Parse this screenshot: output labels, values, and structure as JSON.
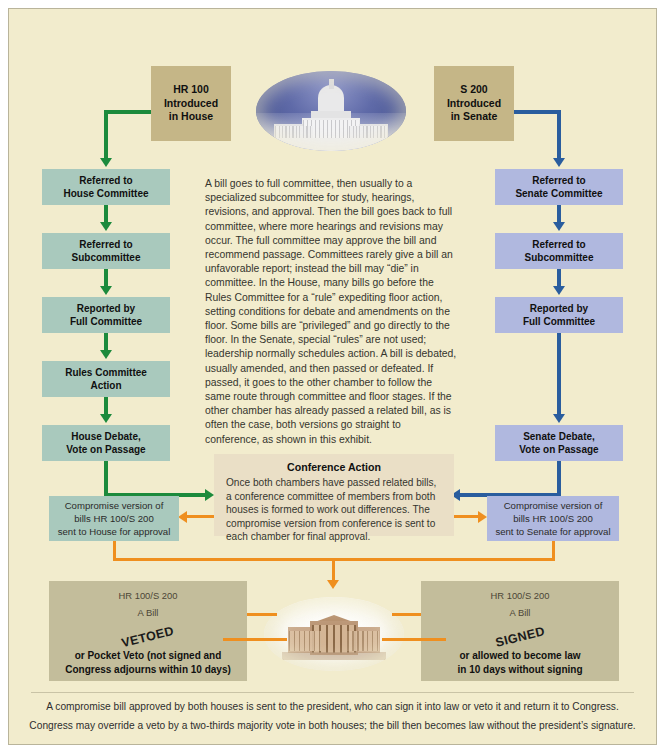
{
  "diagram": {
    "colors": {
      "background": "#f2eccd",
      "house_box": "#a9c9bd",
      "senate_box": "#b0b8df",
      "intro_box": "#c5b687",
      "conference_box": "#eadfc6",
      "bottom_box": "#c3bd9b",
      "house_arrow": "#1c8a3c",
      "senate_arrow": "#2a5d9e",
      "conference_arrow": "#ef8f1f"
    },
    "intro": {
      "house": "HR 100\nIntroduced\nin House",
      "house_lines": [
        "HR 100",
        "Introduced",
        "in House"
      ],
      "senate_lines": [
        "S 200",
        "Introduced",
        "in Senate"
      ]
    },
    "house_steps": [
      {
        "lines": [
          "Referred to",
          "House Committee"
        ]
      },
      {
        "lines": [
          "Referred to",
          "Subcommittee"
        ]
      },
      {
        "lines": [
          "Reported by",
          "Full Committee"
        ]
      },
      {
        "lines": [
          "Rules Committee",
          "Action"
        ]
      },
      {
        "lines": [
          "House Debate,",
          "Vote on Passage"
        ]
      }
    ],
    "senate_steps": [
      {
        "lines": [
          "Referred to",
          "Senate Committee"
        ]
      },
      {
        "lines": [
          "Referred to",
          "Subcommittee"
        ]
      },
      {
        "lines": [
          "Reported by",
          "Full Committee"
        ]
      },
      {
        "lines": [
          "Senate Debate,",
          "Vote on Passage"
        ]
      }
    ],
    "center_text": "A bill goes to full committee, then usually to a specialized subcommittee for study, hearings, revisions, and approval. Then the bill goes back to full committee, where more hearings and revisions may occur. The full committee may approve the bill and recommend passage. Committees rarely give a bill an unfavorable report; instead the bill may “die” in committee. In the House, many bills go before the Rules Committee for a “rule” expediting floor action, setting conditions for debate and amendments on the floor. Some bills are “privileged” and go directly to the floor. In the Senate, special “rules” are not used; leadership normally schedules action. A bill is debated, usually amended, and then passed or defeated. If passed, it goes to the other chamber to follow the same route through committee and floor stages. If the other chamber has already passed a related bill, as is often the case, both versions go straight to conference, as shown in this exhibit.",
    "conference": {
      "title": "Conference Action",
      "text": "Once both chambers have passed related bills, a conference committee of members from both houses is formed to work out differences. The compromise version from conference is sent to each chamber for final approval."
    },
    "compromise_house": {
      "lines": [
        "Compromise version of",
        "bills HR 100/S 200",
        "sent to House for approval"
      ]
    },
    "compromise_senate": {
      "lines": [
        "Compromise version of",
        "bills HR 100/S 200",
        "sent to Senate for approval"
      ]
    },
    "veto_box": {
      "bill_id": "HR 100/S 200",
      "bill_label": "A Bill",
      "stamp": "VETOED",
      "lines": [
        "or Pocket Veto (not signed and",
        "Congress adjourns within 10 days)"
      ]
    },
    "signed_box": {
      "bill_id": "HR 100/S 200",
      "bill_label": "A Bill",
      "stamp": "SIGNED",
      "lines": [
        "or allowed to become law",
        "in 10 days without signing"
      ]
    },
    "caption": {
      "line1": "A compromise bill approved by both houses is sent to the president, who can sign it into law or veto it and return it to Congress.",
      "line2": "Congress may override a veto by a two-thirds majority vote in both houses; the bill then becomes law without the president’s signature."
    },
    "images": {
      "capitol": "us-capitol-photo",
      "whitehouse": "white-house-photo"
    }
  }
}
